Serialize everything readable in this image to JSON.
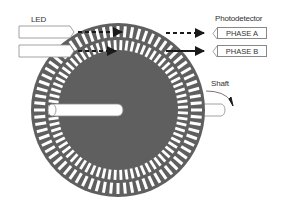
{
  "labels": {
    "led": "LED",
    "photodetector": "Photodetector",
    "phase_a": "PHASE A",
    "phase_b": "PHASE B",
    "shaft": "Shaft"
  },
  "colors": {
    "disc": "#5f5f5f",
    "slot": "#ffffff",
    "outline": "#8a8a8a",
    "arrow": "#1a1a1a"
  },
  "disc": {
    "cx": 118,
    "cy": 110,
    "r": 87,
    "outer_ring": {
      "r_in": 73,
      "r_out": 84,
      "slots": 72
    },
    "inner_ring": {
      "r_in": 60,
      "r_out": 70,
      "slots": 72
    }
  }
}
